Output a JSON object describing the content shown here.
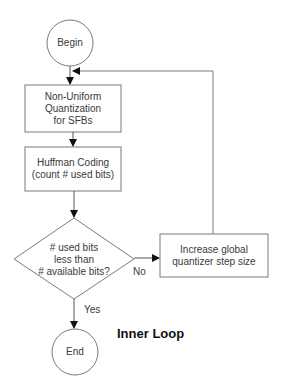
{
  "diagram": {
    "title": "Inner Loop",
    "type": "flowchart",
    "nodes": {
      "begin": {
        "shape": "circle",
        "label": "Begin"
      },
      "quantization": {
        "shape": "rectangle",
        "line1": "Non-Uniform",
        "line2": "Quantization",
        "line3": "for SFBs"
      },
      "huffman": {
        "shape": "rectangle",
        "line1": "Huffman Coding",
        "line2": "(count # used bits)"
      },
      "decision": {
        "shape": "diamond",
        "line1": "# used bits",
        "line2": "less than",
        "line3": "# available bits?"
      },
      "increase": {
        "shape": "rectangle",
        "line1": "Increase global",
        "line2": "quantizer step size"
      },
      "end": {
        "shape": "circle",
        "label": "End"
      }
    },
    "edges": {
      "yes_label": "Yes",
      "no_label": "No"
    },
    "colors": {
      "stroke": "#7a7a7a",
      "arrow": "#111111",
      "text": "#3a3a3a",
      "background": "#ffffff"
    }
  }
}
